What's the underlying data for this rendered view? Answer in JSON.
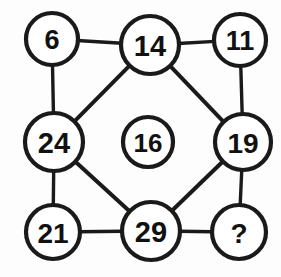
{
  "puzzle": {
    "type": "number-network-puzzle",
    "background_color": "#fdfdfd",
    "stroke_color": "#1a1a1a",
    "text_color": "#111111",
    "nodes": [
      {
        "id": "top-left",
        "label": "6",
        "cx": 52,
        "cy": 39,
        "r": 26,
        "font_size": 27
      },
      {
        "id": "top-center",
        "label": "14",
        "cx": 150,
        "cy": 45,
        "r": 29,
        "font_size": 29
      },
      {
        "id": "top-right",
        "label": "11",
        "cx": 240,
        "cy": 40,
        "r": 26,
        "font_size": 27
      },
      {
        "id": "middle-left",
        "label": "24",
        "cx": 54,
        "cy": 142,
        "r": 29,
        "font_size": 29
      },
      {
        "id": "center",
        "label": "16",
        "cx": 148,
        "cy": 142,
        "r": 25,
        "font_size": 26
      },
      {
        "id": "middle-right",
        "label": "19",
        "cx": 243,
        "cy": 142,
        "r": 28,
        "font_size": 28
      },
      {
        "id": "bottom-left",
        "label": "21",
        "cx": 53,
        "cy": 232,
        "r": 27,
        "font_size": 28
      },
      {
        "id": "bottom-center",
        "label": "29",
        "cx": 151,
        "cy": 231,
        "r": 29,
        "font_size": 29
      },
      {
        "id": "bottom-right",
        "label": "?",
        "cx": 239,
        "cy": 232,
        "r": 27,
        "font_size": 28
      }
    ],
    "edges": [
      {
        "id": "edge-6-14",
        "from": "top-left",
        "to": "top-center",
        "kind": "horizontal"
      },
      {
        "id": "edge-14-11",
        "from": "top-center",
        "to": "top-right",
        "kind": "horizontal"
      },
      {
        "id": "edge-6-24",
        "from": "top-left",
        "to": "middle-left",
        "kind": "vertical"
      },
      {
        "id": "edge-11-19",
        "from": "top-right",
        "to": "middle-right",
        "kind": "vertical"
      },
      {
        "id": "edge-24-21",
        "from": "middle-left",
        "to": "bottom-left",
        "kind": "vertical"
      },
      {
        "id": "edge-19-q",
        "from": "middle-right",
        "to": "bottom-right",
        "kind": "vertical"
      },
      {
        "id": "edge-21-29",
        "from": "bottom-left",
        "to": "bottom-center",
        "kind": "horizontal"
      },
      {
        "id": "edge-29-q",
        "from": "bottom-center",
        "to": "bottom-right",
        "kind": "horizontal"
      },
      {
        "id": "edge-14-24",
        "from": "top-center",
        "to": "middle-left",
        "kind": "diagonal"
      },
      {
        "id": "edge-14-19",
        "from": "top-center",
        "to": "middle-right",
        "kind": "diagonal"
      },
      {
        "id": "edge-24-29",
        "from": "middle-left",
        "to": "bottom-center",
        "kind": "diagonal"
      },
      {
        "id": "edge-19-29",
        "from": "middle-right",
        "to": "bottom-center",
        "kind": "diagonal"
      }
    ]
  }
}
